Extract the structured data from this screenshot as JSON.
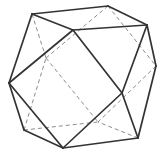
{
  "figure": {
    "background_color": "#ffffff",
    "canvas": {
      "width": 167,
      "height": 155
    },
    "solid_style": {
      "color": "#333333",
      "width": 1.7
    },
    "dashed_style": {
      "color": "#8c8c8c",
      "width": 1.0,
      "dash": "4 3"
    },
    "vertices": {
      "A": {
        "x": 32,
        "y": 14,
        "hidden": false,
        "label": "top-left"
      },
      "B": {
        "x": 108,
        "y": 6,
        "hidden": false,
        "label": "top"
      },
      "C": {
        "x": 147,
        "y": 25,
        "hidden": false,
        "label": "top-right"
      },
      "I": {
        "x": 73,
        "y": 30,
        "hidden": false,
        "label": "top-front"
      },
      "D": {
        "x": 156,
        "y": 66,
        "hidden": false,
        "label": "right"
      },
      "K": {
        "x": 122,
        "y": 93,
        "hidden": false,
        "label": "front-center"
      },
      "H": {
        "x": 9,
        "y": 83,
        "hidden": false,
        "label": "left"
      },
      "J": {
        "x": 46,
        "y": 58,
        "hidden": true,
        "label": "back-left"
      },
      "E": {
        "x": 138,
        "y": 138,
        "hidden": false,
        "label": "bottom-right"
      },
      "F": {
        "x": 63,
        "y": 148,
        "hidden": false,
        "label": "bottom-front"
      },
      "G": {
        "x": 24,
        "y": 130,
        "hidden": false,
        "label": "bottom-left"
      },
      "L": {
        "x": 98,
        "y": 122,
        "hidden": true,
        "label": "back-bottom"
      }
    },
    "solid_edges": [
      [
        "A",
        "B"
      ],
      [
        "B",
        "C"
      ],
      [
        "C",
        "I"
      ],
      [
        "I",
        "A"
      ],
      [
        "C",
        "D"
      ],
      [
        "D",
        "E"
      ],
      [
        "E",
        "K"
      ],
      [
        "K",
        "C"
      ],
      [
        "I",
        "K"
      ],
      [
        "K",
        "F"
      ],
      [
        "F",
        "H"
      ],
      [
        "H",
        "I"
      ],
      [
        "A",
        "H"
      ],
      [
        "E",
        "F"
      ],
      [
        "F",
        "G"
      ],
      [
        "G",
        "H"
      ]
    ],
    "dashed_edges": [
      [
        "A",
        "J"
      ],
      [
        "B",
        "J"
      ],
      [
        "G",
        "J"
      ],
      [
        "J",
        "L"
      ],
      [
        "B",
        "D"
      ],
      [
        "D",
        "L"
      ],
      [
        "E",
        "L"
      ],
      [
        "G",
        "L"
      ]
    ]
  }
}
